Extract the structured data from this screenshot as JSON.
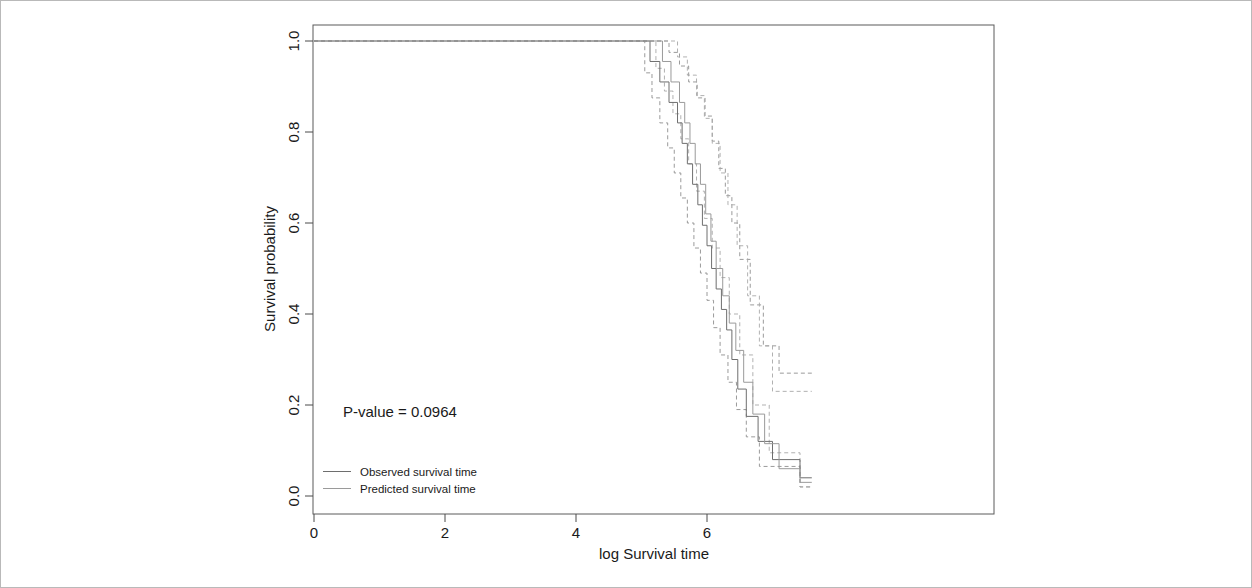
{
  "chart_data": {
    "type": "line",
    "title": "",
    "xlabel": "log Survival time",
    "ylabel": "Survival probability",
    "xlim": [
      0,
      7.6
    ],
    "ylim": [
      0,
      1
    ],
    "xticks": [
      0,
      2,
      4,
      6
    ],
    "xtick_labels": [
      "0",
      "2",
      "4",
      "6"
    ],
    "yticks": [
      0.0,
      0.2,
      0.4,
      0.6,
      0.8,
      1.0
    ],
    "ytick_labels": [
      "0.0",
      "0.2",
      "0.4",
      "0.6",
      "0.8",
      "1.0"
    ],
    "grid": false,
    "legend_position": "bottom-left",
    "annotations": [
      {
        "text": "P-value = 0.0964",
        "x": 0.45,
        "y": 0.2
      }
    ],
    "legend": [
      {
        "name": "Observed survival time",
        "style": "solid",
        "color": "#6e6e6e"
      },
      {
        "name": "Predicted survival time",
        "style": "solid",
        "color": "#9a9a9a"
      }
    ],
    "series": [
      {
        "name": "Observed survival time",
        "style": "solid",
        "color": "#6e6e6e",
        "step": "post",
        "x": [
          0.0,
          5.07,
          5.13,
          5.28,
          5.42,
          5.55,
          5.62,
          5.7,
          5.78,
          5.86,
          5.93,
          6.0,
          6.07,
          6.14,
          6.22,
          6.3,
          6.38,
          6.47,
          6.6,
          6.78,
          7.0,
          7.42
        ],
        "y": [
          1.0,
          1.0,
          0.955,
          0.91,
          0.865,
          0.82,
          0.775,
          0.73,
          0.685,
          0.64,
          0.595,
          0.55,
          0.5,
          0.455,
          0.41,
          0.365,
          0.3,
          0.235,
          0.175,
          0.12,
          0.08,
          0.04
        ]
      },
      {
        "name": "Predicted survival time",
        "style": "solid",
        "color": "#9a9a9a",
        "step": "post",
        "x": [
          0.0,
          5.2,
          5.32,
          5.45,
          5.58,
          5.66,
          5.74,
          5.82,
          5.9,
          5.98,
          6.06,
          6.14,
          6.24,
          6.34,
          6.44,
          6.56,
          6.7,
          6.88,
          7.1,
          7.42
        ],
        "y": [
          1.0,
          1.0,
          0.955,
          0.91,
          0.865,
          0.82,
          0.775,
          0.73,
          0.685,
          0.62,
          0.56,
          0.5,
          0.44,
          0.38,
          0.32,
          0.25,
          0.18,
          0.115,
          0.06,
          0.03
        ]
      },
      {
        "name": "Observed upper confidence bound",
        "style": "dashed",
        "color": "#8e8e8e",
        "step": "post",
        "x": [
          0.0,
          5.28,
          5.42,
          5.58,
          5.72,
          5.85,
          5.97,
          6.08,
          6.18,
          6.28,
          6.38,
          6.5,
          6.66,
          6.86,
          7.1,
          7.42
        ],
        "y": [
          1.0,
          1.0,
          0.975,
          0.945,
          0.91,
          0.875,
          0.835,
          0.78,
          0.72,
          0.66,
          0.6,
          0.52,
          0.42,
          0.33,
          0.27,
          0.27
        ]
      },
      {
        "name": "Observed lower confidence bound",
        "style": "dashed",
        "color": "#8e8e8e",
        "step": "post",
        "x": [
          0.0,
          4.98,
          5.05,
          5.16,
          5.28,
          5.4,
          5.5,
          5.6,
          5.7,
          5.8,
          5.9,
          6.0,
          6.1,
          6.2,
          6.32,
          6.45,
          6.6,
          6.8,
          7.42
        ],
        "y": [
          1.0,
          1.0,
          0.93,
          0.875,
          0.82,
          0.765,
          0.71,
          0.655,
          0.6,
          0.545,
          0.49,
          0.43,
          0.37,
          0.31,
          0.25,
          0.19,
          0.13,
          0.065,
          0.02
        ]
      },
      {
        "name": "Predicted upper confidence bound",
        "style": "dashed",
        "color": "#a8a8a8",
        "step": "post",
        "x": [
          0.0,
          5.4,
          5.55,
          5.7,
          5.84,
          5.96,
          6.08,
          6.2,
          6.32,
          6.46,
          6.62,
          6.8,
          7.0,
          7.42
        ],
        "y": [
          1.0,
          1.0,
          0.965,
          0.925,
          0.88,
          0.83,
          0.775,
          0.71,
          0.64,
          0.55,
          0.44,
          0.33,
          0.23,
          0.23
        ]
      },
      {
        "name": "Predicted lower confidence bound",
        "style": "dashed",
        "color": "#a8a8a8",
        "step": "post",
        "x": [
          0.0,
          5.1,
          5.22,
          5.35,
          5.48,
          5.6,
          5.72,
          5.84,
          5.96,
          6.08,
          6.2,
          6.34,
          6.5,
          6.7,
          6.95,
          7.42
        ],
        "y": [
          1.0,
          1.0,
          0.94,
          0.89,
          0.84,
          0.785,
          0.73,
          0.67,
          0.61,
          0.545,
          0.48,
          0.4,
          0.31,
          0.2,
          0.095,
          0.02
        ]
      }
    ]
  },
  "annotation": {
    "pvalue": "P-value = 0.0964"
  },
  "axes": {
    "x_title": "log Survival time",
    "y_title": "Survival probability",
    "x_ticks": [
      "0",
      "2",
      "4",
      "6"
    ],
    "y_ticks": [
      "0.0",
      "0.2",
      "0.4",
      "0.6",
      "0.8",
      "1.0"
    ]
  },
  "legend": {
    "items": [
      {
        "label": "Observed survival time"
      },
      {
        "label": "Predicted survival time"
      }
    ]
  }
}
